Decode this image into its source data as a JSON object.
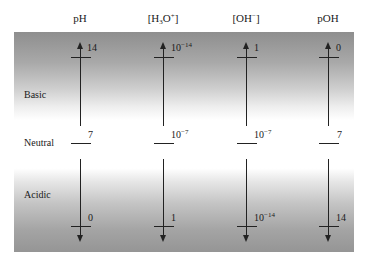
{
  "columns": [
    {
      "id": "ph",
      "header": "pH",
      "x": 80,
      "top_value": "14",
      "neutral_value": "7",
      "bottom_value": "0"
    },
    {
      "id": "h3o",
      "header_base": "[H",
      "header_sub": "3",
      "header_mid": "O",
      "header_sup": "+",
      "header_end": "]",
      "x": 163,
      "top_base": "10",
      "top_exp": "−14",
      "neutral_base": "10",
      "neutral_exp": "−7",
      "bottom_value": "1"
    },
    {
      "id": "oh",
      "header_base": "[OH",
      "header_sup": "−",
      "header_end": "]",
      "x": 246,
      "top_value": "1",
      "neutral_base": "10",
      "neutral_exp": "−7",
      "bottom_base": "10",
      "bottom_exp": "−14"
    },
    {
      "id": "poh",
      "header": "pOH",
      "x": 328,
      "top_value": "0",
      "neutral_value": "7",
      "bottom_value": "14"
    }
  ],
  "regions": {
    "basic": "Basic",
    "neutral": "Neutral",
    "acidic": "Acidic"
  },
  "colors": {
    "gradient_dark": "#8e8e8e",
    "gradient_light": "#ffffff",
    "line": "#222222"
  }
}
